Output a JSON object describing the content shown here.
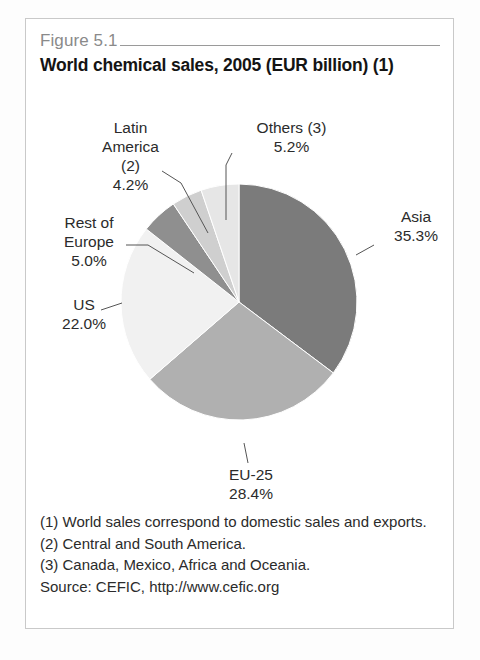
{
  "figure": {
    "number": "Figure 5.1",
    "title": "World chemical sales, 2005 (EUR billion) (1)"
  },
  "labels": {
    "latin_america": "Latin\nAmerica\n(2)\n4.2%",
    "rest_of_europe": "Rest of\nEurope\n5.0%",
    "us": "US\n22.0%",
    "others": "Others (3)\n5.2%",
    "asia": "Asia\n35.3%",
    "eu25": "EU-25\n28.4%"
  },
  "footnotes": {
    "note1": "(1) World sales correspond to domestic sales and exports.",
    "note2": "(2) Central and South America.",
    "note3": "(3) Canada, Mexico, Africa and Oceania.",
    "source": "Source: CEFIC, http://www.cefic.org"
  },
  "chart_data": {
    "type": "pie",
    "title": "World chemical sales, 2005 (EUR billion) (1)",
    "unit": "percent",
    "start_angle_deg": 0,
    "direction": "clockwise",
    "legend": "none",
    "labels_position": "outside-with-leader-lines",
    "categories": [
      "Asia",
      "EU-25",
      "US",
      "Rest of Europe",
      "Latin America (2)",
      "Others (3)"
    ],
    "values": [
      35.3,
      28.4,
      22.0,
      5.0,
      4.2,
      5.2
    ],
    "slice_colors": [
      "#7b7b7b",
      "#b0b0b0",
      "#f1f1f1",
      "#8f8f8f",
      "#cfcfcf",
      "#e6e6e6"
    ],
    "slices": [
      {
        "name": "Asia",
        "value": 35.3,
        "label": "Asia\n35.3%",
        "color": "#7b7b7b"
      },
      {
        "name": "EU-25",
        "value": 28.4,
        "label": "EU-25\n28.4%",
        "color": "#b0b0b0"
      },
      {
        "name": "US",
        "value": 22.0,
        "label": "US\n22.0%",
        "color": "#f1f1f1"
      },
      {
        "name": "Rest of Europe",
        "value": 5.0,
        "label": "Rest of\nEurope\n5.0%",
        "color": "#8f8f8f"
      },
      {
        "name": "Latin America (2)",
        "value": 4.2,
        "label": "Latin\nAmerica\n(2)\n4.2%",
        "color": "#cfcfcf"
      },
      {
        "name": "Others (3)",
        "value": 5.2,
        "label": "Others (3)\n5.2%",
        "color": "#e6e6e6"
      }
    ],
    "source": "CEFIC, http://www.cefic.org"
  }
}
